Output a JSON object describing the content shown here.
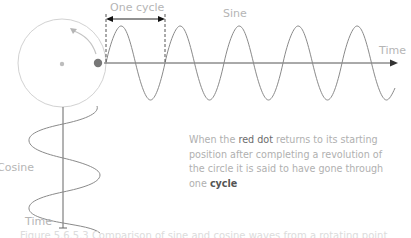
{
  "diagram": {
    "labels": {
      "one_cycle": "One cycle",
      "sine": "Sine",
      "time_horizontal": "Time",
      "cosine": "Cosine",
      "time_vertical": "Time"
    },
    "description": {
      "part1": "When the ",
      "highlight_dot": "red dot",
      "part2": " returns to its starting position after completing a revolution of the circle it is said to have gone through ",
      "part3": "one ",
      "highlight_cycle": "cycle"
    },
    "caption": "Figure 5.6.5.3 Comparison of sine and cosine waves from a rotating point",
    "colors": {
      "circle": "#cfcfcf",
      "wave": "#8a8a8a",
      "axis": "#555555",
      "dot": "#777777",
      "text": "#b0b0b0"
    }
  }
}
